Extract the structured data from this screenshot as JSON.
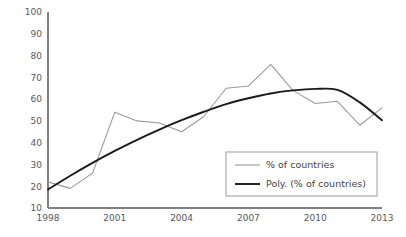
{
  "chart_data": {
    "type": "line",
    "title": "",
    "xlabel": "",
    "ylabel": "",
    "x": [
      1998,
      1999,
      2000,
      2001,
      2002,
      2003,
      2004,
      2005,
      2006,
      2007,
      2008,
      2009,
      2010,
      2011,
      2012,
      2013
    ],
    "series": [
      {
        "name": "% of countries",
        "type": "line",
        "color": "#9a9a9a",
        "values": [
          22,
          19,
          26,
          54,
          50,
          49,
          45,
          52,
          65,
          66,
          76,
          64,
          58,
          59,
          48,
          56
        ]
      },
      {
        "name": "Poly. (% of countries)",
        "type": "trendline",
        "color": "#1a1a1a",
        "values": [
          18.5,
          24.8,
          30.7,
          36.2,
          41.3,
          46.0,
          50.3,
          54.2,
          57.7,
          60.4,
          62.6,
          64.0,
          64.7,
          64.2,
          58.5,
          50.3
        ]
      }
    ],
    "ylim": [
      10,
      100
    ],
    "yticks": [
      10,
      20,
      30,
      40,
      50,
      60,
      70,
      80,
      90,
      100
    ],
    "ytick_labels": [
      "10",
      "20",
      "30",
      "40",
      "50",
      "60",
      "70",
      "80",
      "90",
      "100"
    ],
    "xlim": [
      1998,
      2013
    ],
    "xticks": [
      1998,
      2001,
      2004,
      2007,
      2010,
      2013
    ],
    "xtick_labels": [
      "1998",
      "2001",
      "2004",
      "2007",
      "2010",
      "2013"
    ],
    "grid": false,
    "legend_position": "inside-bottom-right"
  },
  "legend": {
    "entries": [
      {
        "label": "% of countries",
        "color": "#9a9a9a",
        "weight": "thin"
      },
      {
        "label": "Poly. (% of countries)",
        "color": "#1a1a1a",
        "weight": "thick"
      }
    ]
  },
  "colors": {
    "background": "#ffffff",
    "axis": "#808080",
    "tick_text": "#595959",
    "series_primary": "#9a9a9a",
    "series_trend": "#1a1a1a",
    "legend_border": "#9a9a9a"
  }
}
